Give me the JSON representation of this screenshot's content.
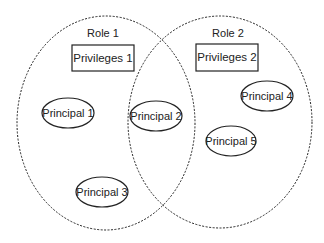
{
  "diagram": {
    "type": "venn",
    "colors": {
      "background": "#ffffff",
      "stroke": "#222222",
      "text": "#222222"
    },
    "roles": [
      {
        "label": "Role 1",
        "privileges": "Privileges 1",
        "members": [
          "Principal 1",
          "Principal 2",
          "Principal 3"
        ]
      },
      {
        "label": "Role 2",
        "privileges": "Privileges 2",
        "members": [
          "Principal 2",
          "Principal 4",
          "Principal 5"
        ]
      }
    ],
    "principals": [
      {
        "label": "Principal 1",
        "region": "Role 1 only"
      },
      {
        "label": "Principal 2",
        "region": "Role 1 and Role 2"
      },
      {
        "label": "Principal 3",
        "region": "Role 1 only"
      },
      {
        "label": "Principal 4",
        "region": "Role 2 only"
      },
      {
        "label": "Principal 5",
        "region": "Role 2 only"
      }
    ]
  }
}
